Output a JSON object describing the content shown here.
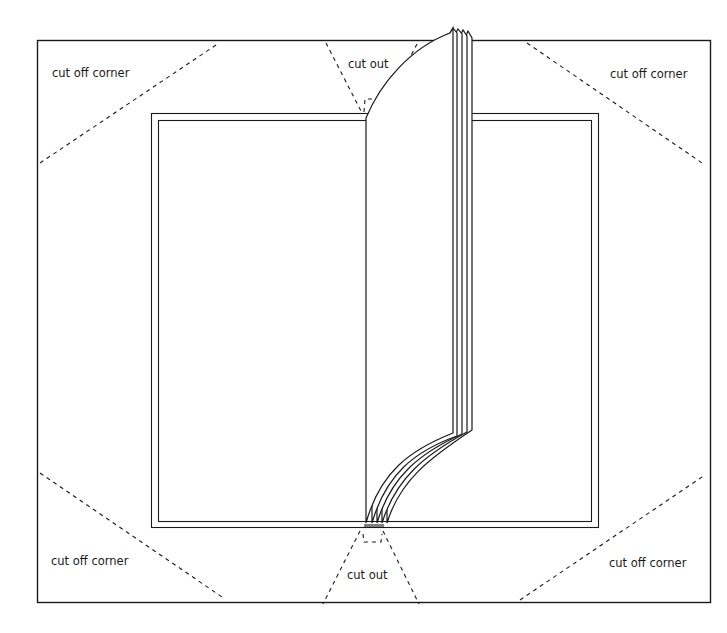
{
  "diagram": {
    "type": "book-cover-template",
    "colors": {
      "line": "#1a1a1a",
      "background": "#ffffff"
    },
    "labels": {
      "top_left": "cut off corner",
      "top_right": "cut off corner",
      "bottom_left": "cut off corner",
      "bottom_right": "cut off corner",
      "top_center": "cut out",
      "bottom_center": "cut out"
    }
  }
}
